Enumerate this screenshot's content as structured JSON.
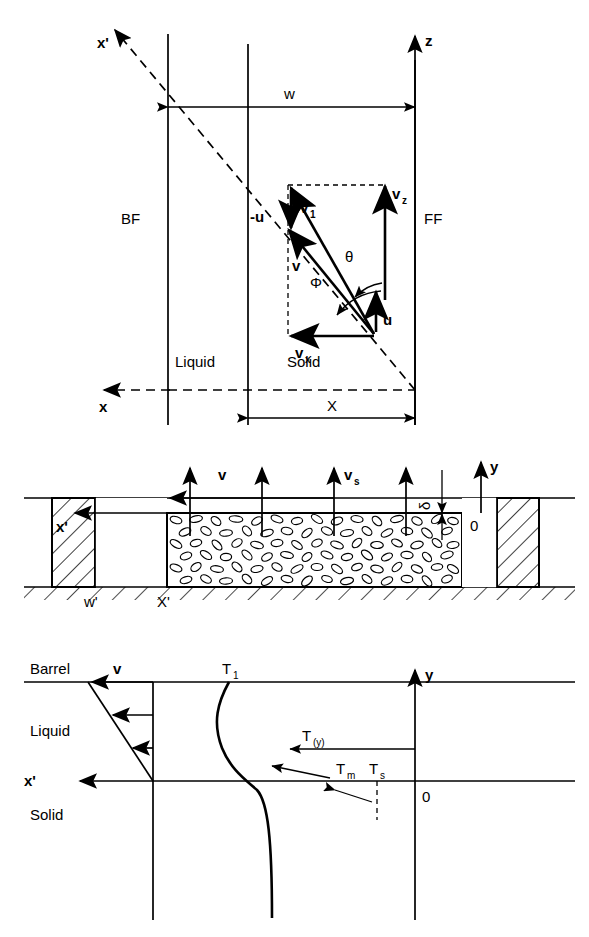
{
  "panel1": {
    "name": "velocity-vector-diagram",
    "axes": {
      "x_prime": "x'",
      "z": "z",
      "x": "x"
    },
    "regions": {
      "left_flight": "BF",
      "right_flight": "FF",
      "liquid": "Liquid",
      "solid": "Solid"
    },
    "dimensions": {
      "channel_width": "w",
      "solid_width": "X"
    },
    "vectors": {
      "v1": "v",
      "v1_sub": "1",
      "v": "v",
      "vz": "v",
      "vz_sub": "z",
      "vx": "v",
      "vx_sub": "x",
      "u": "u",
      "minus_u": "-u"
    },
    "angles": {
      "theta": "θ",
      "phi": "Φ"
    }
  },
  "panel2": {
    "name": "solid-bed-cross-section",
    "axes": {
      "x_prime": "x'",
      "y": "y",
      "origin": "0"
    },
    "labels": {
      "melt_velocity": "v",
      "solid_velocity": "v",
      "solid_velocity_sub": "s",
      "film_thickness": "δ",
      "flight_width": "w'",
      "bed_width": "X'"
    }
  },
  "panel3": {
    "name": "temperature-velocity-profile",
    "axes": {
      "x_prime": "x'",
      "y": "y",
      "origin": "0"
    },
    "regions": {
      "barrel": "Barrel",
      "liquid": "Liquid",
      "solid": "Solid"
    },
    "labels": {
      "velocity": "v",
      "barrel_temp": "T",
      "barrel_temp_sub": "1",
      "temp_profile": "T",
      "temp_profile_sub": "(y)",
      "melt_temp": "T",
      "melt_temp_sub": "m",
      "solid_temp": "T",
      "solid_temp_sub": "s"
    }
  },
  "colors": {
    "ink": "#000000",
    "paper": "#ffffff"
  }
}
